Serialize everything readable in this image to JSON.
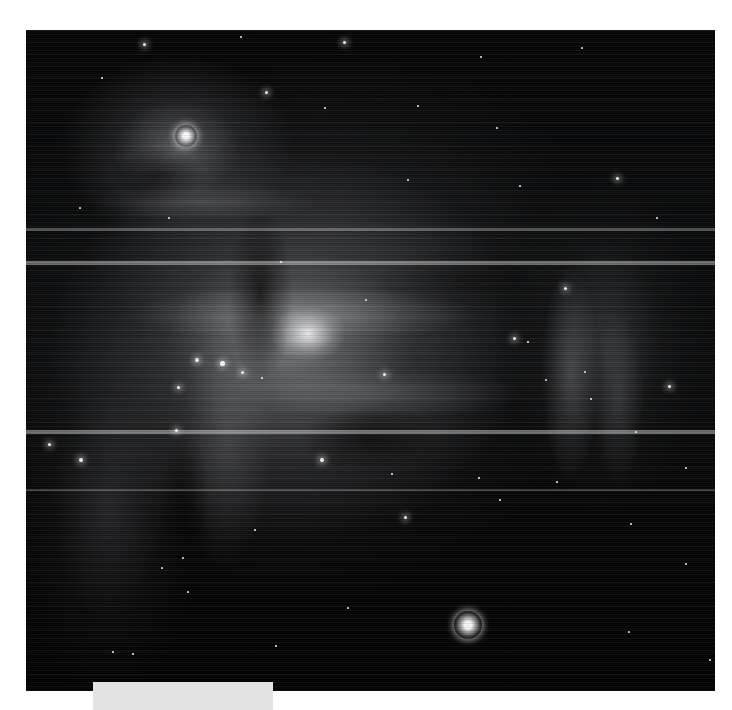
{
  "page": {
    "background_color": "#ffffff",
    "width": 732,
    "height": 710
  },
  "image_plate": {
    "name": "astronomical-image",
    "subject": "Orion Nebula (M42 / M43) emission nebula field",
    "rendering": "grayscale / monochrome",
    "background_color": "#020203",
    "bounds": {
      "left": 26,
      "top": 30,
      "width": 689,
      "height": 661
    },
    "artifacts": {
      "description": "horizontal scan-line striping and bright readout glitch bands",
      "glitch_bands": [
        {
          "top": 198,
          "height": 3,
          "opacity": 0.3
        },
        {
          "top": 231,
          "height": 4,
          "opacity": 0.42
        },
        {
          "top": 400,
          "height": 4,
          "opacity": 0.4
        },
        {
          "top": 459,
          "height": 2,
          "opacity": 0.22
        }
      ]
    },
    "stars": [
      {
        "x": 118,
        "y": 14,
        "size": 3,
        "glow": true
      },
      {
        "x": 215,
        "y": 7,
        "size": 2,
        "glow": false
      },
      {
        "x": 318,
        "y": 12,
        "size": 3,
        "glow": true
      },
      {
        "x": 455,
        "y": 27,
        "size": 2,
        "glow": false
      },
      {
        "x": 556,
        "y": 18,
        "size": 2,
        "glow": false
      },
      {
        "x": 76,
        "y": 48,
        "size": 2,
        "glow": false
      },
      {
        "x": 160,
        "y": 106,
        "size": 7,
        "glow": true,
        "big": true
      },
      {
        "x": 240,
        "y": 62,
        "size": 3,
        "glow": true
      },
      {
        "x": 299,
        "y": 78,
        "size": 2,
        "glow": false
      },
      {
        "x": 392,
        "y": 76,
        "size": 2,
        "glow": false
      },
      {
        "x": 471,
        "y": 98,
        "size": 2,
        "glow": false
      },
      {
        "x": 382,
        "y": 150,
        "size": 2,
        "glow": false
      },
      {
        "x": 494,
        "y": 156,
        "size": 2,
        "glow": false
      },
      {
        "x": 54,
        "y": 178,
        "size": 2,
        "glow": false
      },
      {
        "x": 143,
        "y": 188,
        "size": 2,
        "glow": false
      },
      {
        "x": 591,
        "y": 148,
        "size": 3,
        "glow": true
      },
      {
        "x": 631,
        "y": 188,
        "size": 2,
        "glow": false
      },
      {
        "x": 255,
        "y": 232,
        "size": 2,
        "glow": false
      },
      {
        "x": 340,
        "y": 270,
        "size": 2,
        "glow": false
      },
      {
        "x": 539,
        "y": 258,
        "size": 3,
        "glow": true
      },
      {
        "x": 171,
        "y": 330,
        "size": 4,
        "glow": true
      },
      {
        "x": 196,
        "y": 333,
        "size": 5,
        "glow": true
      },
      {
        "x": 216,
        "y": 342,
        "size": 3,
        "glow": true
      },
      {
        "x": 152,
        "y": 357,
        "size": 3,
        "glow": true
      },
      {
        "x": 236,
        "y": 348,
        "size": 2,
        "glow": false
      },
      {
        "x": 358,
        "y": 344,
        "size": 3,
        "glow": true
      },
      {
        "x": 488,
        "y": 308,
        "size": 3,
        "glow": true
      },
      {
        "x": 502,
        "y": 312,
        "size": 2,
        "glow": false
      },
      {
        "x": 520,
        "y": 350,
        "size": 2,
        "glow": false
      },
      {
        "x": 559,
        "y": 342,
        "size": 2,
        "glow": false
      },
      {
        "x": 565,
        "y": 369,
        "size": 2,
        "glow": false
      },
      {
        "x": 643,
        "y": 356,
        "size": 3,
        "glow": true
      },
      {
        "x": 610,
        "y": 402,
        "size": 2,
        "glow": false
      },
      {
        "x": 23,
        "y": 414,
        "size": 3,
        "glow": true
      },
      {
        "x": 55,
        "y": 430,
        "size": 4,
        "glow": true
      },
      {
        "x": 150,
        "y": 400,
        "size": 3,
        "glow": true
      },
      {
        "x": 296,
        "y": 430,
        "size": 4,
        "glow": true
      },
      {
        "x": 366,
        "y": 444,
        "size": 2,
        "glow": false
      },
      {
        "x": 453,
        "y": 448,
        "size": 2,
        "glow": false
      },
      {
        "x": 474,
        "y": 470,
        "size": 2,
        "glow": false
      },
      {
        "x": 531,
        "y": 452,
        "size": 2,
        "glow": false
      },
      {
        "x": 660,
        "y": 438,
        "size": 2,
        "glow": false
      },
      {
        "x": 379,
        "y": 487,
        "size": 3,
        "glow": true
      },
      {
        "x": 136,
        "y": 538,
        "size": 2,
        "glow": false
      },
      {
        "x": 157,
        "y": 528,
        "size": 2,
        "glow": false
      },
      {
        "x": 229,
        "y": 500,
        "size": 2,
        "glow": false
      },
      {
        "x": 605,
        "y": 494,
        "size": 2,
        "glow": false
      },
      {
        "x": 660,
        "y": 534,
        "size": 2,
        "glow": false
      },
      {
        "x": 442,
        "y": 595,
        "size": 9,
        "glow": true,
        "big": true
      },
      {
        "x": 162,
        "y": 562,
        "size": 2,
        "glow": false
      },
      {
        "x": 322,
        "y": 578,
        "size": 2,
        "glow": false
      },
      {
        "x": 250,
        "y": 616,
        "size": 2,
        "glow": false
      },
      {
        "x": 87,
        "y": 622,
        "size": 2,
        "glow": false
      },
      {
        "x": 107,
        "y": 624,
        "size": 2,
        "glow": false
      },
      {
        "x": 603,
        "y": 602,
        "size": 2,
        "glow": false
      },
      {
        "x": 684,
        "y": 630,
        "size": 2,
        "glow": false
      }
    ]
  },
  "caption": {
    "name": "caption-placeholder",
    "text": "",
    "background_color": "#e3e3e3",
    "bounds": {
      "left": 93,
      "top": 682,
      "width": 180,
      "height": 28
    }
  }
}
